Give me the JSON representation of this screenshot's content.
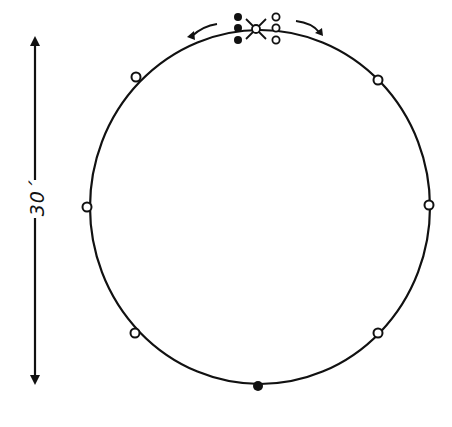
{
  "diagram": {
    "type": "game-formation",
    "dimension_label": "30´",
    "circle": {
      "cx": 260,
      "cy": 207,
      "rx": 170,
      "ry": 177
    },
    "colors": {
      "ink": "#111111",
      "background": "#ffffff"
    },
    "ring_players": [
      {
        "id": "top-left",
        "x": 136,
        "y": 77,
        "style": "open"
      },
      {
        "id": "top-right",
        "x": 378,
        "y": 80,
        "style": "open"
      },
      {
        "id": "left",
        "x": 87,
        "y": 207,
        "style": "open"
      },
      {
        "id": "right",
        "x": 429,
        "y": 205,
        "style": "open"
      },
      {
        "id": "bottom-left",
        "x": 135,
        "y": 333,
        "style": "open"
      },
      {
        "id": "bottom-right",
        "x": 378,
        "y": 333,
        "style": "open"
      },
      {
        "id": "bottom",
        "x": 258,
        "y": 386,
        "style": "filled"
      }
    ],
    "top_group": {
      "filled_column": [
        {
          "x": 238,
          "y": 17
        },
        {
          "x": 238,
          "y": 28
        },
        {
          "x": 238,
          "y": 40
        }
      ],
      "open_column": [
        {
          "x": 276,
          "y": 17
        },
        {
          "x": 276,
          "y": 28
        },
        {
          "x": 276,
          "y": 40
        }
      ],
      "center_crossed": {
        "x": 256,
        "y": 29
      },
      "arrows": [
        {
          "direction": "left-outward"
        },
        {
          "direction": "right-outward"
        }
      ]
    },
    "measure_line": {
      "x": 35,
      "y1": 38,
      "y2": 383
    }
  }
}
